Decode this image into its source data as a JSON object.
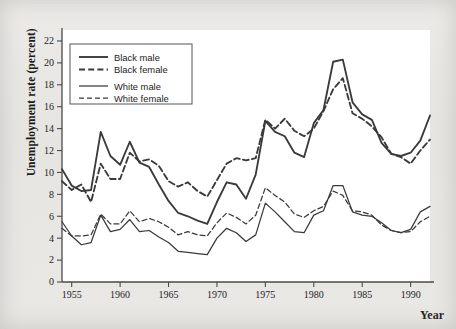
{
  "chart_data": {
    "type": "line",
    "title": "",
    "xlabel": "Year",
    "ylabel": "Unemployment rate (percent)",
    "xlim": [
      1954,
      1992
    ],
    "ylim": [
      0,
      23
    ],
    "grid": false,
    "legend_position": "top-left",
    "xticks": [
      1955,
      1960,
      1965,
      1970,
      1975,
      1980,
      1985,
      1990
    ],
    "yticks": [
      0,
      2,
      4,
      6,
      8,
      10,
      12,
      14,
      16,
      18,
      20,
      22
    ],
    "x": [
      1954,
      1955,
      1956,
      1957,
      1958,
      1959,
      1960,
      1961,
      1962,
      1963,
      1964,
      1965,
      1966,
      1967,
      1968,
      1969,
      1970,
      1971,
      1972,
      1973,
      1974,
      1975,
      1976,
      1977,
      1978,
      1979,
      1980,
      1981,
      1982,
      1983,
      1984,
      1985,
      1986,
      1987,
      1988,
      1989,
      1990,
      1991,
      1992
    ],
    "series": [
      {
        "name": "Black male",
        "style": "solid",
        "width": "thick",
        "color": "#3a3a3a",
        "values": [
          10.3,
          8.8,
          8.3,
          8.4,
          13.7,
          11.5,
          10.7,
          12.8,
          10.9,
          10.5,
          8.9,
          7.4,
          6.3,
          6.0,
          5.6,
          5.3,
          7.3,
          9.1,
          8.9,
          7.6,
          9.8,
          14.7,
          13.7,
          13.3,
          11.8,
          11.4,
          14.5,
          15.7,
          20.1,
          20.3,
          16.4,
          15.3,
          14.8,
          12.7,
          11.7,
          11.5,
          11.8,
          12.9,
          15.2
        ]
      },
      {
        "name": "Black female",
        "style": "dashed",
        "width": "thick",
        "color": "#3a3a3a",
        "values": [
          9.2,
          8.4,
          8.9,
          7.3,
          10.8,
          9.4,
          9.4,
          11.8,
          11.0,
          11.2,
          10.6,
          9.2,
          8.7,
          9.1,
          8.3,
          7.8,
          9.3,
          10.8,
          11.3,
          11.1,
          11.3,
          14.8,
          14.0,
          14.9,
          13.8,
          13.3,
          14.0,
          15.6,
          17.6,
          18.6,
          15.4,
          14.9,
          14.2,
          13.2,
          11.7,
          11.4,
          10.8,
          12.0,
          13.0
        ]
      },
      {
        "name": "White male",
        "style": "solid",
        "width": "thin",
        "color": "#3a3a3a",
        "values": [
          5.5,
          4.2,
          3.4,
          3.6,
          6.1,
          4.6,
          4.8,
          5.7,
          4.6,
          4.7,
          4.1,
          3.6,
          2.8,
          2.7,
          2.6,
          2.5,
          4.0,
          4.9,
          4.5,
          3.7,
          4.3,
          7.2,
          6.4,
          5.5,
          4.6,
          4.5,
          6.1,
          6.5,
          8.8,
          8.8,
          6.4,
          6.1,
          6.0,
          5.4,
          4.7,
          4.5,
          4.8,
          6.4,
          6.9
        ]
      },
      {
        "name": "White female",
        "style": "dashed",
        "width": "thin",
        "color": "#3a3a3a",
        "values": [
          4.9,
          4.2,
          4.2,
          4.3,
          6.2,
          5.3,
          5.3,
          6.5,
          5.5,
          5.8,
          5.5,
          5.0,
          4.3,
          4.6,
          4.3,
          4.2,
          5.4,
          6.3,
          5.9,
          5.3,
          6.1,
          8.6,
          7.9,
          7.3,
          6.2,
          5.9,
          6.5,
          6.9,
          8.3,
          7.9,
          6.5,
          6.4,
          6.1,
          5.2,
          4.7,
          4.5,
          4.6,
          5.5,
          6.0
        ]
      }
    ]
  },
  "legend": {
    "items": [
      {
        "label": "Black male"
      },
      {
        "label": "Black female"
      },
      {
        "label": "White male"
      },
      {
        "label": "White female"
      }
    ]
  },
  "axis_labels": {
    "y": "Unemployment rate (percent)",
    "x": "Year"
  }
}
